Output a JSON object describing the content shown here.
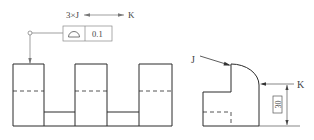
{
  "diagram": {
    "callout": {
      "text_left": "3×J",
      "text_right": "K",
      "arrow": "between-arrow",
      "frame": {
        "symbol": "profile-of-a-surface",
        "tolerance_value": "0.1"
      }
    },
    "front_view": {
      "description": "Comb profile with three raised bosses",
      "boss_count": 3
    },
    "side_view": {
      "label_J": "J",
      "label_K": "K",
      "basic_dimension": "30"
    },
    "colors": {
      "line": "#2a2a2a",
      "thin_line": "#777777",
      "text": "#444444"
    }
  }
}
